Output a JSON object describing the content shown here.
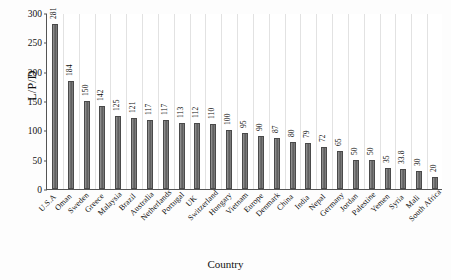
{
  "chart_data": {
    "type": "bar",
    "title": "",
    "xlabel": "Country",
    "ylabel": "L/P/D",
    "ylim": [
      0,
      300
    ],
    "yticks": [
      0,
      50,
      100,
      150,
      200,
      250,
      300
    ],
    "grid": "vertical-separators",
    "legend": "none",
    "bar_color": "#6f6f6f",
    "categories": [
      "U.S.A",
      "Oman",
      "Sweden",
      "Greece",
      "Malaysia",
      "Brazil",
      "Australia",
      "Netherlands",
      "Portugal",
      "UK",
      "Switzerland",
      "Hungary",
      "Vietnam",
      "Europe",
      "Denmark",
      "China",
      "India",
      "Nepal",
      "Germany",
      "Jordan",
      "Palestine",
      "Yemen",
      "Syria",
      "Mali",
      "South Africa"
    ],
    "values": [
      281,
      184,
      150,
      142,
      125,
      121,
      117,
      117,
      113,
      112,
      110,
      100,
      95,
      90,
      87,
      80,
      79,
      72,
      65,
      50,
      50,
      35,
      33.8,
      30,
      20
    ],
    "value_labels": [
      "281",
      "184",
      "150",
      "142",
      "125",
      "121",
      "117",
      "117",
      "113",
      "112",
      "110",
      "100",
      "95",
      "90",
      "87",
      "80",
      "79",
      "72",
      "65",
      "50",
      "50",
      "35",
      "33.8",
      "30",
      "20"
    ]
  }
}
